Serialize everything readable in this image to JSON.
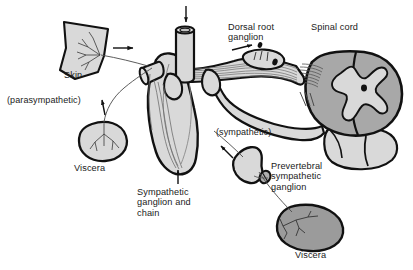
{
  "figure": {
    "width": 413,
    "height": 270,
    "background": "#ffffff"
  },
  "palette": {
    "outline": "#111111",
    "light_gray_fill": "#d9d9d9",
    "mid_gray_fill": "#c4c4c4",
    "spinal_gray_fill": "#a8a8a8",
    "dark_viscera_fill": "#9b9b9b",
    "nerve_line": "#6e6e6e",
    "text": "#1a1a1a",
    "white": "#ffffff"
  },
  "labels": {
    "skin": {
      "text": "Skin",
      "x": 64,
      "y": 76
    },
    "parasympathetic": {
      "text": "(parasympathetic)",
      "x": 7,
      "y": 101
    },
    "viscera_upper": {
      "text": "Viscera",
      "x": 74,
      "y": 168
    },
    "sympathetic_ganglion_chain": {
      "text": "Sympathetic\nganglion and\nchain",
      "x": 137,
      "y": 186
    },
    "dorsal_root_ganglion": {
      "text": "Dorsal root\nganglion",
      "x": 228,
      "y": 23
    },
    "spinal_cord": {
      "text": "Spinal cord",
      "x": 311,
      "y": 23
    },
    "sympathetic": {
      "text": "(sympathetic)",
      "x": 216,
      "y": 131
    },
    "prevertebral_sympathetic_ganglion": {
      "text": "Prevertebral\nsympathetic\nganglion",
      "x": 270,
      "y": 164
    },
    "viscera_lower": {
      "text": "Viscera",
      "x": 295,
      "y": 252
    }
  },
  "structures": [
    {
      "name": "skin-patch",
      "description": "Quadrilateral flap of skin with branching sensory nerve endings",
      "fill": "#d9d9d9"
    },
    {
      "name": "upper-viscera",
      "description": "Rounded organ with branching parasympathetic innervation",
      "fill": "#d9d9d9"
    },
    {
      "name": "lower-viscera",
      "description": "Oval organ with branching sympathetic innervation",
      "fill": "#9b9b9b"
    },
    {
      "name": "spinal-cord-segment",
      "description": "Spinal cord cross-section with butterfly-shaped gray matter and central canal",
      "fill": "#a8a8a8"
    },
    {
      "name": "dorsal-root-ganglion",
      "description": "Swelling on the dorsal root containing sensory neuron cell bodies",
      "fill": "#d9d9d9"
    },
    {
      "name": "sympathetic-chain-ganglion",
      "description": "Paravertebral ganglion connected in a vertical chain",
      "fill": "#d9d9d9"
    },
    {
      "name": "prevertebral-ganglion",
      "description": "Irregular ganglion anterior to the vertebral column",
      "fill": "#d9d9d9"
    },
    {
      "name": "spinal-nerve-trunk",
      "description": "Mixed spinal nerve trunk leaving the vertebral canal",
      "fill": "#d9d9d9"
    }
  ],
  "arrows": [
    {
      "name": "skin-afferent-arrow",
      "description": "Arrow from skin toward spinal nerve (afferent direction)"
    },
    {
      "name": "parasympathetic-afferent-arrow",
      "description": "Arrow along the parasympathetic pathway from viscera"
    },
    {
      "name": "dorsal-root-arrow",
      "description": "Arrow along dorsal root toward the spinal cord"
    },
    {
      "name": "descending-ramus-arrow",
      "description": "Downward arrow at the top ramus entering the trunk"
    },
    {
      "name": "prevertebral-arrow",
      "description": "Arrow from the sympathetic trunk toward the prevertebral ganglion"
    },
    {
      "name": "sympathetic-chain-arrow",
      "description": "Upward arrow from the sympathetic ganglion and chain label"
    }
  ]
}
